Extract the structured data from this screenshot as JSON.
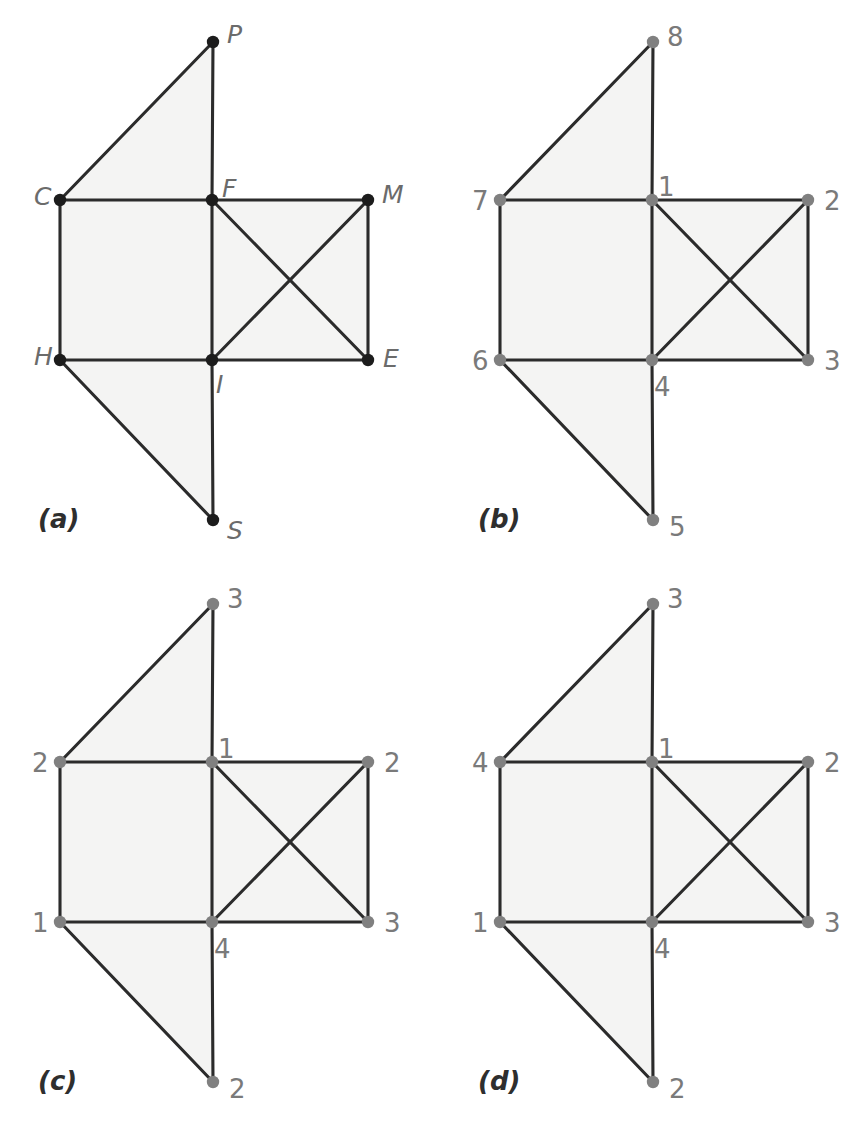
{
  "figure": {
    "background_color": "#ffffff",
    "face_fill_color": "#f4f4f3",
    "edge_color": "#2b2b2b",
    "label_color_alpha": "#6b6b6b",
    "label_color_numeric": "#7a7a7a",
    "vertex_color_black": "#1c1c1c",
    "vertex_color_grey": "#808080"
  },
  "chart_data": {
    "type": "diagram",
    "geometry": {
      "positions": {
        "P": [
          213,
          42
        ],
        "C": [
          60,
          200
        ],
        "F": [
          212,
          200
        ],
        "M": [
          368,
          200
        ],
        "H": [
          60,
          360
        ],
        "I": [
          212,
          360
        ],
        "E": [
          368,
          360
        ],
        "S": [
          213,
          520
        ]
      },
      "edges": [
        [
          "P",
          "C"
        ],
        [
          "P",
          "F"
        ],
        [
          "C",
          "F"
        ],
        [
          "F",
          "M"
        ],
        [
          "C",
          "H"
        ],
        [
          "F",
          "I"
        ],
        [
          "M",
          "E"
        ],
        [
          "H",
          "I"
        ],
        [
          "I",
          "E"
        ],
        [
          "F",
          "E"
        ],
        [
          "I",
          "M"
        ],
        [
          "H",
          "S"
        ],
        [
          "I",
          "S"
        ]
      ],
      "faces": [
        [
          "P",
          "C",
          "F"
        ],
        [
          "C",
          "F",
          "I",
          "H"
        ],
        [
          "F",
          "M",
          "E",
          "I"
        ],
        [
          "H",
          "I",
          "S"
        ]
      ]
    },
    "panels": [
      {
        "id": "a",
        "caption": "(a)",
        "vertex_style": "black",
        "label_style": "italic-letter",
        "labels": {
          "P": "P",
          "C": "C",
          "F": "F",
          "M": "M",
          "H": "H",
          "I": "I",
          "E": "E",
          "S": "S"
        },
        "label_offsets": {
          "P": [
            14,
            -6
          ],
          "C": [
            -26,
            -2
          ],
          "F": [
            10,
            -10
          ],
          "M": [
            14,
            -4
          ],
          "H": [
            -26,
            -2
          ],
          "I": [
            4,
            26
          ],
          "E": [
            15,
            0
          ],
          "S": [
            14,
            12
          ]
        }
      },
      {
        "id": "b",
        "caption": "(b)",
        "vertex_style": "grey",
        "label_style": "numeric",
        "labels": {
          "P": "8",
          "C": "7",
          "F": "1",
          "M": "2",
          "H": "6",
          "I": "4",
          "E": "3",
          "S": "5"
        },
        "label_offsets": {
          "P": [
            14,
            -4
          ],
          "C": [
            -28,
            2
          ],
          "F": [
            6,
            -12
          ],
          "M": [
            16,
            2
          ],
          "H": [
            -28,
            2
          ],
          "I": [
            2,
            28
          ],
          "E": [
            16,
            2
          ],
          "S": [
            16,
            8
          ]
        }
      },
      {
        "id": "c",
        "caption": "(c)",
        "vertex_style": "grey",
        "label_style": "numeric",
        "labels": {
          "P": "3",
          "C": "2",
          "F": "1",
          "M": "2",
          "H": "1",
          "I": "4",
          "E": "3",
          "S": "2"
        },
        "label_offsets": {
          "P": [
            14,
            -4
          ],
          "C": [
            -28,
            2
          ],
          "F": [
            6,
            -12
          ],
          "M": [
            16,
            2
          ],
          "H": [
            -28,
            2
          ],
          "I": [
            2,
            28
          ],
          "E": [
            16,
            2
          ],
          "S": [
            16,
            8
          ]
        }
      },
      {
        "id": "d",
        "caption": "(d)",
        "vertex_style": "grey",
        "label_style": "numeric",
        "labels": {
          "P": "3",
          "C": "4",
          "F": "1",
          "M": "2",
          "H": "1",
          "I": "4",
          "E": "3",
          "S": "2"
        },
        "label_offsets": {
          "P": [
            14,
            -4
          ],
          "C": [
            -28,
            2
          ],
          "F": [
            6,
            -12
          ],
          "M": [
            16,
            2
          ],
          "H": [
            -28,
            2
          ],
          "I": [
            2,
            28
          ],
          "E": [
            16,
            2
          ],
          "S": [
            16,
            8
          ]
        }
      }
    ],
    "panel_layout": [
      {
        "id": "a",
        "origin": [
          0,
          0
        ],
        "caption_pos": [
          38,
          528
        ]
      },
      {
        "id": "b",
        "origin": [
          440,
          0
        ],
        "caption_pos": [
          478,
          528
        ]
      },
      {
        "id": "c",
        "origin": [
          0,
          562
        ],
        "caption_pos": [
          38,
          1090
        ]
      },
      {
        "id": "d",
        "origin": [
          440,
          562
        ],
        "caption_pos": [
          478,
          1090
        ]
      }
    ]
  }
}
